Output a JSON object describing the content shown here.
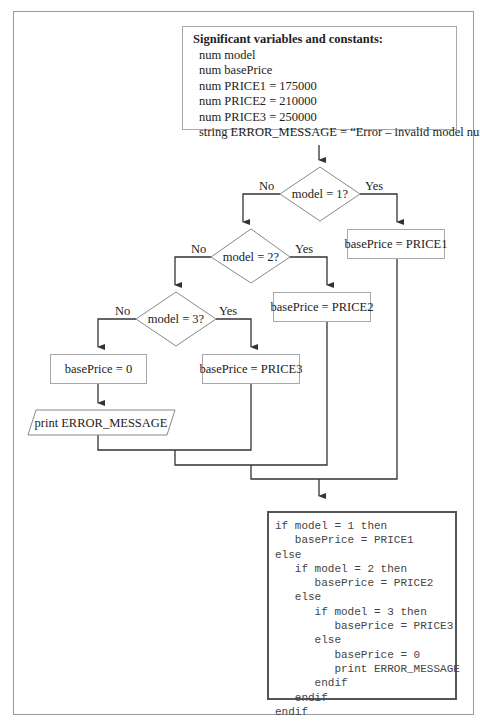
{
  "variables_box": {
    "title": "Significant variables and constants:",
    "lines": [
      "num model",
      "num basePrice",
      "num PRICE1 = 175000",
      "num PRICE2 = 210000",
      "num PRICE3 = 250000",
      "string ERROR_MESSAGE = “Error – invalid model number”"
    ]
  },
  "decisions": [
    {
      "label": "model = 1?",
      "no": "No",
      "yes": "Yes"
    },
    {
      "label": "model = 2?",
      "no": "No",
      "yes": "Yes"
    },
    {
      "label": "model = 3?",
      "no": "No",
      "yes": "Yes"
    }
  ],
  "processes": {
    "price1": "basePrice = PRICE1",
    "price2": "basePrice = PRICE2",
    "price3": "basePrice = PRICE3",
    "zero": "basePrice = 0"
  },
  "output": {
    "label": "print ERROR_MESSAGE"
  },
  "pseudocode": {
    "lines": [
      "if model = 1 then",
      "   basePrice = PRICE1",
      "else",
      "   if model = 2 then",
      "      basePrice = PRICE2",
      "   else",
      "      if model = 3 then",
      "         basePrice = PRICE3",
      "      else",
      "         basePrice = 0",
      "         print ERROR_MESSAGE",
      "      endif",
      "   endif",
      "endif"
    ]
  },
  "colors": {
    "line": "#333333",
    "box_border": "#a8a8a8",
    "frame": "#9a9a9a"
  }
}
